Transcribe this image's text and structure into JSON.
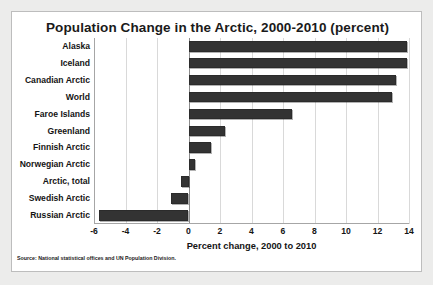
{
  "chart_data": {
    "type": "bar",
    "orientation": "horizontal",
    "title": "Population Change in the Arctic, 2000-2010 (percent)",
    "xlabel": "Percent change, 2000 to 2010",
    "ylabel": "",
    "xlim": [
      -6,
      14
    ],
    "xticks": [
      "-6",
      "-4",
      "-2",
      "0",
      "2",
      "4",
      "6",
      "8",
      "10",
      "12",
      "14"
    ],
    "xtick_values": [
      -6,
      -4,
      -2,
      0,
      2,
      4,
      6,
      8,
      10,
      12,
      14
    ],
    "grid": true,
    "legend": "none",
    "categories": [
      "Alaska",
      "Iceland",
      "Canadian Arctic",
      "World",
      "Faroe Islands",
      "Greenland",
      "Finnish Arctic",
      "Norwegian Arctic",
      "Arctic, total",
      "Swedish Arctic",
      "Russian Arctic"
    ],
    "values": [
      13.9,
      13.9,
      13.2,
      12.9,
      6.6,
      2.3,
      1.4,
      0.4,
      -0.5,
      -1.1,
      -5.7
    ],
    "bar_color": "#333333",
    "source": "Source: National statistical offices and UN Population Division."
  }
}
